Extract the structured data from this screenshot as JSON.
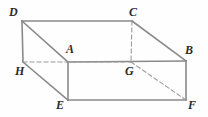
{
  "figure": {
    "kind": "cuboid-wireframe",
    "width": 208,
    "height": 117,
    "background_color": "#fefefe",
    "solid_edge_color": "#8a8a8a",
    "hidden_edge_color": "#9a9a9a",
    "label_color": "#2b2b2b",
    "solid_stroke_width": 1.6,
    "hidden_stroke_width": 1.1,
    "hidden_dash_pattern": "4,3"
  },
  "vertices": [
    {
      "id": "D",
      "label": "D",
      "x": 22,
      "y": 21,
      "label_x": 9,
      "label_y": 6,
      "hidden": false
    },
    {
      "id": "C",
      "label": "C",
      "x": 132,
      "y": 21,
      "label_x": 129,
      "label_y": 6,
      "hidden": false
    },
    {
      "id": "A",
      "label": "A",
      "x": 68,
      "y": 62,
      "label_x": 66,
      "label_y": 43,
      "hidden": false
    },
    {
      "id": "B",
      "label": "B",
      "x": 186,
      "y": 61,
      "label_x": 185,
      "label_y": 44,
      "hidden": false
    },
    {
      "id": "H",
      "label": "H",
      "x": 23,
      "y": 62,
      "label_x": 15,
      "label_y": 65,
      "hidden": true
    },
    {
      "id": "G",
      "label": "G",
      "x": 131,
      "y": 62,
      "label_x": 125,
      "label_y": 65,
      "hidden": true
    },
    {
      "id": "E",
      "label": "E",
      "x": 68,
      "y": 100,
      "label_x": 56,
      "label_y": 99,
      "hidden": false
    },
    {
      "id": "F",
      "label": "F",
      "x": 186,
      "y": 100,
      "label_x": 188,
      "label_y": 99,
      "hidden": false
    }
  ],
  "edges": [
    {
      "id": "DC",
      "from": "D",
      "to": "C",
      "style": "solid"
    },
    {
      "id": "DA",
      "from": "D",
      "to": "A",
      "style": "solid"
    },
    {
      "id": "AB",
      "from": "A",
      "to": "B",
      "style": "solid"
    },
    {
      "id": "CB",
      "from": "C",
      "to": "B",
      "style": "solid"
    },
    {
      "id": "DH",
      "from": "D",
      "to": "H",
      "style": "solid"
    },
    {
      "id": "AE",
      "from": "A",
      "to": "E",
      "style": "solid"
    },
    {
      "id": "BF",
      "from": "B",
      "to": "F",
      "style": "solid"
    },
    {
      "id": "EF",
      "from": "E",
      "to": "F",
      "style": "solid"
    },
    {
      "id": "HE",
      "from": "H",
      "to": "E",
      "style": "solid"
    },
    {
      "id": "HG",
      "from": "H",
      "to": "G",
      "style": "dashed"
    },
    {
      "id": "CG",
      "from": "C",
      "to": "G",
      "style": "dashed"
    },
    {
      "id": "GF",
      "from": "G",
      "to": "F",
      "style": "dashed"
    }
  ]
}
